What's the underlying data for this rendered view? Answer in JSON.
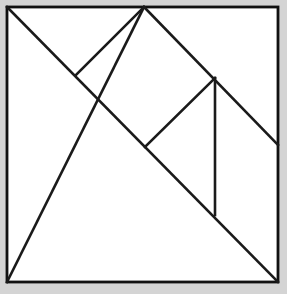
{
  "figure": {
    "type": "line-diagram",
    "canvas": {
      "width": 287,
      "height": 294
    },
    "background_color": "#d4d4d4",
    "plate_color": "#ffffff",
    "line_color": "#1a1a1a",
    "line_width": 2.6,
    "square": {
      "name": "outer-square",
      "left": 7,
      "top": 7,
      "right": 278,
      "bottom": 282,
      "width": 271,
      "height": 275
    },
    "points": {
      "top_left": {
        "x": 7,
        "y": 7
      },
      "top_right": {
        "x": 278,
        "y": 7
      },
      "bottom_left": {
        "x": 7,
        "y": 282
      },
      "bottom_right": {
        "x": 278,
        "y": 282
      },
      "top_apex": {
        "x": 144,
        "y": 7
      },
      "right_mid": {
        "x": 278,
        "y": 145
      },
      "center": {
        "x": 145,
        "y": 147
      },
      "left_notch": {
        "x": 76,
        "y": 75
      },
      "right_notch": {
        "x": 215,
        "y": 78
      },
      "vertical_foot": {
        "x": 215,
        "y": 215
      }
    },
    "cuts": [
      {
        "name": "main-diagonal",
        "x1": 7,
        "y1": 7,
        "x2": 278,
        "y2": 282
      },
      {
        "name": "big-triangle-hypotenuse",
        "x1": 7,
        "y1": 282,
        "x2": 144,
        "y2": 7
      },
      {
        "name": "apex-to-right-mid",
        "x1": 144,
        "y1": 7,
        "x2": 278,
        "y2": 145
      },
      {
        "name": "square-top-left-edge",
        "x1": 76,
        "y1": 75,
        "x2": 144,
        "y2": 7
      },
      {
        "name": "center-to-right-notch",
        "x1": 145,
        "y1": 147,
        "x2": 215,
        "y2": 78
      },
      {
        "name": "vertical-cut",
        "x1": 215,
        "y1": 78,
        "x2": 215,
        "y2": 215
      }
    ],
    "piece_count": 7,
    "pieces": [
      "large-triangle-lower-left",
      "large-triangle-upper-right",
      "medium-triangle",
      "small-triangle-top",
      "small-triangle-right",
      "square",
      "parallelogram"
    ]
  }
}
